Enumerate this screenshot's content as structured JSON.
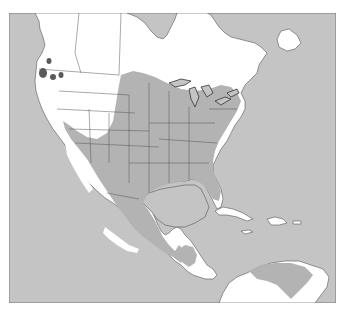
{
  "map": {
    "title": "",
    "type": "species range map",
    "region": "North America, Central America, Caribbean, northern South America",
    "colors": {
      "water": "#c4c4c4",
      "land": "#ffffff",
      "range": "#b3b3b3",
      "range_dark": "#5a5a5a",
      "border": "#555555",
      "frame": "#777777"
    },
    "legend": [],
    "labels": [],
    "features": [
      {
        "name": "main-range",
        "description": "Central/eastern United States, southern Great Lakes, Mexico and Texas"
      },
      {
        "name": "central-america-range",
        "description": "Guatemala/Honduras interior"
      },
      {
        "name": "south-america-range",
        "description": "Northern Venezuela / Colombia"
      },
      {
        "name": "pacific-northwest-patches",
        "description": "Isolated dark patches in Washington/Oregon"
      }
    ]
  }
}
